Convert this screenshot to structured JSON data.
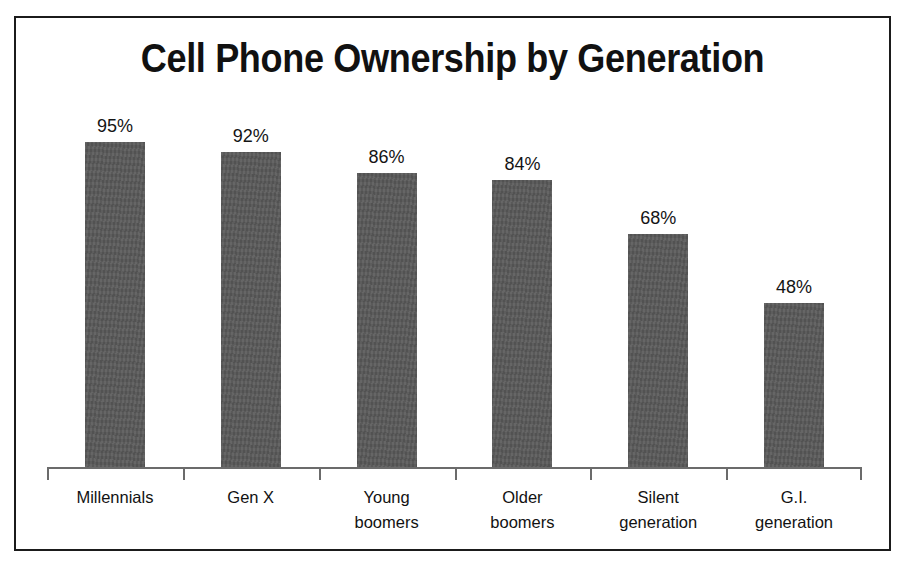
{
  "chart_data": {
    "type": "bar",
    "title": "Cell Phone Ownership by Generation",
    "xlabel": "",
    "ylabel": "",
    "ylim": [
      0,
      100
    ],
    "grid": false,
    "legend": "none",
    "categories": [
      "Millennials",
      "Gen X",
      "Young boomers",
      "Older boomers",
      "Silent generation",
      "G.I. generation"
    ],
    "category_lines": [
      [
        "Millennials"
      ],
      [
        "Gen X"
      ],
      [
        "Young",
        "boomers"
      ],
      [
        "Older",
        "boomers"
      ],
      [
        "Silent",
        "generation"
      ],
      [
        "G.I.",
        "generation"
      ]
    ],
    "values": [
      95,
      92,
      86,
      84,
      68,
      48
    ],
    "value_labels": [
      "95%",
      "92%",
      "86%",
      "84%",
      "68%",
      "48%"
    ],
    "bar_color": "#595959",
    "axis_color": "#6b6b6b",
    "text_color": "#121212",
    "border_color": "#1b1b1b",
    "background": "#ffffff"
  }
}
